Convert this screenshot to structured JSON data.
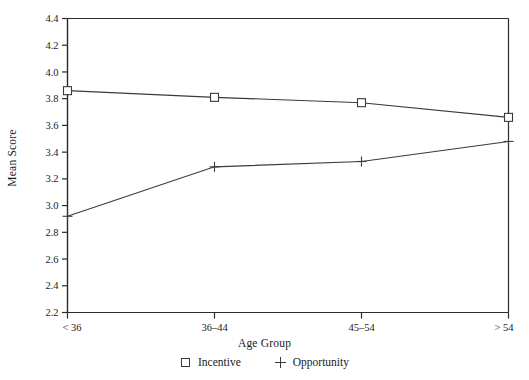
{
  "chart_data": {
    "type": "line",
    "title": "",
    "xlabel": "Age Group",
    "ylabel": "Mean Score",
    "categories": [
      "< 36",
      "36–44",
      "45–54",
      "> 54"
    ],
    "series": [
      {
        "name": "Incentive",
        "marker": "square",
        "values": [
          3.86,
          3.81,
          3.77,
          3.66
        ]
      },
      {
        "name": "Opportunity",
        "marker": "plus",
        "values": [
          2.92,
          3.29,
          3.33,
          3.48
        ]
      }
    ],
    "ylim": [
      2.2,
      4.4
    ],
    "ytick_step": 0.2,
    "yticks": [
      "2.2",
      "2.4",
      "2.6",
      "2.8",
      "3.0",
      "3.2",
      "3.4",
      "3.6",
      "3.8",
      "4.0",
      "4.2",
      "4.4"
    ],
    "grid": false,
    "legend_position": "bottom",
    "line_color": "#3a3a3a",
    "axis_color": "#2b2b2b",
    "background": "#ffffff"
  },
  "legend": {
    "entries": [
      {
        "label": "Incentive",
        "marker": "square"
      },
      {
        "label": "Opportunity",
        "marker": "plus"
      }
    ]
  },
  "axes": {
    "x_title": "Age Group",
    "y_title": "Mean Score"
  }
}
